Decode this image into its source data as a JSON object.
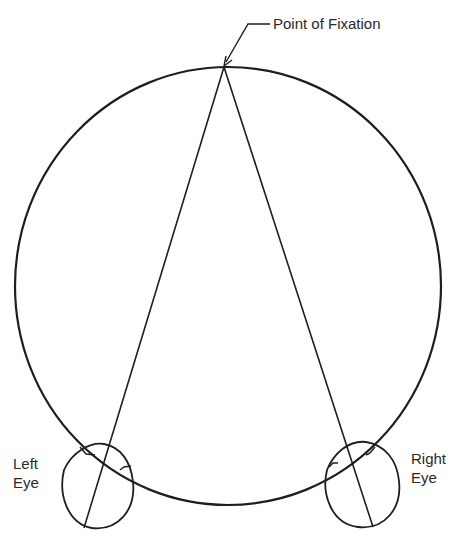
{
  "diagram": {
    "title_label": "Point of Fixation",
    "left_eye": {
      "line1": "Left",
      "line2": "Eye"
    },
    "right_eye": {
      "line1": "Right",
      "line2": "Eye"
    },
    "stroke_color": "#1e1e1e",
    "geometry": {
      "horopter_circle": {
        "cx": 228,
        "cy": 286,
        "rx": 213,
        "ry": 219
      },
      "fixation_point": {
        "x": 224,
        "y": 67
      },
      "left_eye": {
        "cx": 97,
        "cy": 486,
        "rx": 37,
        "ry": 42,
        "axis_end": {
          "x": 84,
          "y": 528
        }
      },
      "right_eye": {
        "cx": 362,
        "cy": 486,
        "rx": 38,
        "ry": 42,
        "axis_end": {
          "x": 373,
          "y": 527
        }
      }
    }
  }
}
